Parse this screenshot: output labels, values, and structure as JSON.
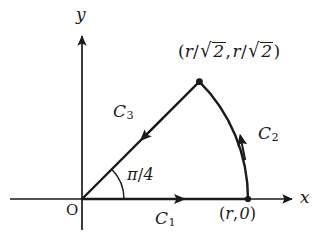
{
  "figure": {
    "kind": "contour-integration-path-diagram",
    "background_color": "#ffffff",
    "stroke_color": "#1a1a1a",
    "axes": {
      "x_label": "x",
      "y_label": "y",
      "origin_label": "O",
      "x_axis_name": "x-axis",
      "y_axis_name": "y-axis"
    },
    "labels": {
      "c1": "C",
      "c1_sub": "1",
      "c2": "C",
      "c2_sub": "2",
      "c3": "C",
      "c3_sub": "3",
      "angle": "π/4",
      "angle_pi": "π",
      "angle_slash": "/",
      "angle_denominator": "4",
      "point_r0": "(r, 0)",
      "point_r0_open": "(",
      "point_r0_var": "r",
      "point_r0_comma": ",",
      "point_r0_zero": "0",
      "point_r0_close": ")",
      "vertex": "(r/√2, r/√2)",
      "vertex_open": "(",
      "vertex_var": "r",
      "vertex_slash": "/",
      "vertex_sqrt": "√",
      "vertex_radicand": "2",
      "vertex_comma": ",",
      "vertex_close": ")"
    },
    "geometry": {
      "origin_x": 82,
      "origin_y": 199,
      "radius": 166,
      "angle_degrees": 45,
      "arc_marker_radius": 42,
      "x_axis_start": 10,
      "x_axis_end": 295,
      "y_axis_top": 33,
      "y_axis_bottom": 230,
      "point_r0_x": 248,
      "point_r0_y": 199,
      "vertex_x": 199,
      "vertex_y": 82
    },
    "paths": [
      {
        "name": "C1",
        "description": "straight segment along x-axis from origin to (r,0)",
        "direction": "rightward"
      },
      {
        "name": "C2",
        "description": "circular arc of radius r from (r,0) counterclockwise to (r/√2, r/√2)",
        "direction": "counterclockwise"
      },
      {
        "name": "C3",
        "description": "straight segment from (r/√2, r/√2) back to origin at angle π/4",
        "direction": "toward-origin"
      }
    ]
  }
}
